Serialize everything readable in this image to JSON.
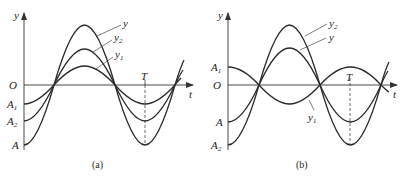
{
  "figure": {
    "panels": [
      {
        "id": "a",
        "caption": "(a)",
        "axis_labels": {
          "y": "y",
          "x": "t",
          "origin": "O",
          "period": "T"
        },
        "curves": [
          {
            "name": "y",
            "label": "y",
            "sub": "",
            "amplitude": "A",
            "phase": "in phase"
          },
          {
            "name": "y2",
            "label": "y",
            "sub": "2",
            "amplitude": "A2",
            "phase": "in phase"
          },
          {
            "name": "y1",
            "label": "y",
            "sub": "1",
            "amplitude": "A1",
            "phase": "in phase"
          }
        ],
        "y_ticks": [
          {
            "label": "A",
            "sub": "1"
          },
          {
            "label": "A",
            "sub": "2"
          },
          {
            "label": "A",
            "sub": ""
          }
        ]
      },
      {
        "id": "b",
        "caption": "(b)",
        "axis_labels": {
          "y": "y",
          "x": "t",
          "origin": "O",
          "period": "T"
        },
        "curves": [
          {
            "name": "y2",
            "label": "y",
            "sub": "2",
            "amplitude": "A2",
            "phase": "reference"
          },
          {
            "name": "y",
            "label": "y",
            "sub": "",
            "amplitude": "A",
            "phase": "resultant"
          },
          {
            "name": "y1",
            "label": "y",
            "sub": "1",
            "amplitude": "A1",
            "phase": "opposite"
          }
        ],
        "y_ticks": [
          {
            "label": "A",
            "sub": "1"
          },
          {
            "label": "A",
            "sub": ""
          },
          {
            "label": "A",
            "sub": "2"
          }
        ]
      }
    ]
  }
}
